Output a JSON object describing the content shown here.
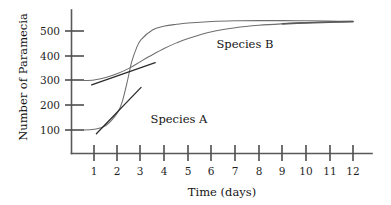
{
  "chart_data": {
    "type": "line",
    "title": "",
    "xlabel": "Time (days)",
    "ylabel": "Number of Paramecia",
    "xlim": [
      0,
      12.6
    ],
    "ylim": [
      0,
      600
    ],
    "grid": false,
    "legend_position": "inline-annotations",
    "xticks": [
      1,
      2,
      3,
      4,
      5,
      6,
      7,
      8,
      9,
      10,
      11,
      12
    ],
    "xtick_labels": [
      "1",
      "2",
      "3",
      "4",
      "5",
      "6",
      "7",
      "8",
      "9",
      "10",
      "11",
      "12"
    ],
    "yticks": [
      100,
      200,
      300,
      400,
      500
    ],
    "ytick_labels": [
      "100",
      "200",
      "300",
      "400",
      "500"
    ],
    "annotations": [
      {
        "text": "Species A",
        "x": 3.4,
        "y": 130
      },
      {
        "text": "Species B",
        "x": 6.2,
        "y": 430
      }
    ],
    "series": [
      {
        "name": "Species A",
        "note": "sigmoid starting near 100, steep rise between days 2 and 3, plateau ~530",
        "x": [
          0.5,
          1.0,
          1.5,
          2.0,
          2.2,
          2.4,
          2.6,
          2.8,
          3.0,
          3.5,
          4.0,
          4.5,
          5.0,
          6.0,
          7.0,
          8.0,
          9.0,
          10.0,
          11.0,
          12.0
        ],
        "y": [
          100,
          103,
          118,
          170,
          215,
          290,
          375,
          430,
          465,
          505,
          520,
          527,
          532,
          538,
          541,
          542,
          542,
          541,
          540,
          539
        ]
      },
      {
        "name": "Species B",
        "note": "starts near 300, gradual rise, plateau ~530",
        "x": [
          0.5,
          1.0,
          1.5,
          2.0,
          2.5,
          3.0,
          3.5,
          4.0,
          4.5,
          5.0,
          6.0,
          7.0,
          8.0,
          9.0,
          10.0,
          11.0,
          12.0
        ],
        "y": [
          300,
          302,
          312,
          328,
          350,
          378,
          405,
          430,
          452,
          470,
          497,
          513,
          523,
          529,
          533,
          536,
          538
        ]
      }
    ],
    "tangent_lines": [
      {
        "name": "tangent-species-b",
        "description": "shallow straight tangent drawn across Species B inflection",
        "x": [
          0.9,
          3.6
        ],
        "y": [
          282,
          372
        ]
      },
      {
        "name": "tangent-species-a",
        "description": "steep straight tangent drawn at Species A inflection",
        "x": [
          1.1,
          3.0
        ],
        "y": [
          85,
          272
        ]
      }
    ]
  },
  "axes": {
    "x_title": "Time (days)",
    "y_title": "Number of Paramecia"
  }
}
